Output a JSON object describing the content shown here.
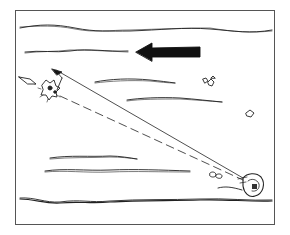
{
  "diagram": {
    "type": "line-illustration",
    "frame": {
      "x": 15,
      "y": 10,
      "width": 260,
      "height": 215
    },
    "colors": {
      "ink": "#222222",
      "background": "#ffffff",
      "frame": "#555555"
    },
    "elements": {
      "current_arrow": {
        "direction": "left",
        "icon": "arrow-left-icon"
      },
      "target_object": {
        "icon": "starburst-object-icon",
        "position": "upper-left"
      },
      "target_motion_arrow": {
        "icon": "arrow-up-right-icon"
      },
      "incoming_arrow": {
        "icon": "arrow-right-icon"
      },
      "device": {
        "icon": "device-icon",
        "position": "lower-right"
      },
      "solid_line": {
        "from": "device",
        "to": "target-arrow"
      },
      "dashed_line": {
        "from": "device",
        "to": "target-object"
      },
      "rocks": [
        {
          "icon": "rock-cluster-icon",
          "position": "upper-right"
        },
        {
          "icon": "rock-icon",
          "position": "right"
        },
        {
          "icon": "rock-pair-icon",
          "position": "lower-right"
        }
      ],
      "wave_lines": 8
    }
  }
}
